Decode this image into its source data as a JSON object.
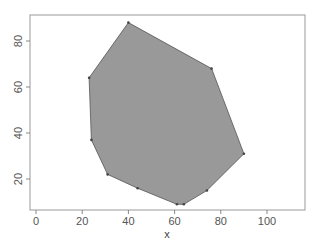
{
  "chart_data": {
    "type": "scatter",
    "title": "",
    "xlabel": "x",
    "ylabel": "",
    "xlim": [
      -3,
      116
    ],
    "ylim": [
      5,
      91
    ],
    "xticks": [
      0,
      20,
      40,
      60,
      80,
      100
    ],
    "yticks": [
      20,
      40,
      60,
      80
    ],
    "xtick_labels": [
      "0",
      "20",
      "40",
      "60",
      "80",
      "100"
    ],
    "ytick_labels": [
      "20",
      "40",
      "60",
      "80"
    ],
    "grid": false,
    "legend": null,
    "series": [
      {
        "name": "convex hull",
        "kind": "filled-polygon",
        "fill": "#999999",
        "stroke": "#555555",
        "points": [
          {
            "x": 40,
            "y": 88
          },
          {
            "x": 76,
            "y": 68
          },
          {
            "x": 90,
            "y": 31
          },
          {
            "x": 74,
            "y": 15
          },
          {
            "x": 64,
            "y": 9
          },
          {
            "x": 61,
            "y": 9
          },
          {
            "x": 44,
            "y": 16
          },
          {
            "x": 31,
            "y": 22
          },
          {
            "x": 24,
            "y": 37
          },
          {
            "x": 23,
            "y": 64
          }
        ]
      }
    ]
  },
  "colors": {
    "fill": "#999999",
    "stroke": "#555555",
    "axis": "#888888",
    "box": "#999999"
  }
}
